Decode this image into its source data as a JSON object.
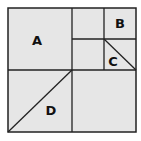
{
  "diagram": {
    "fill_color": "#e6e6e6",
    "line_color": "#222222",
    "regions": [
      {
        "id": "A",
        "label": "A"
      },
      {
        "id": "B",
        "label": "B"
      },
      {
        "id": "C",
        "label": "C"
      },
      {
        "id": "D",
        "label": "D"
      }
    ]
  }
}
